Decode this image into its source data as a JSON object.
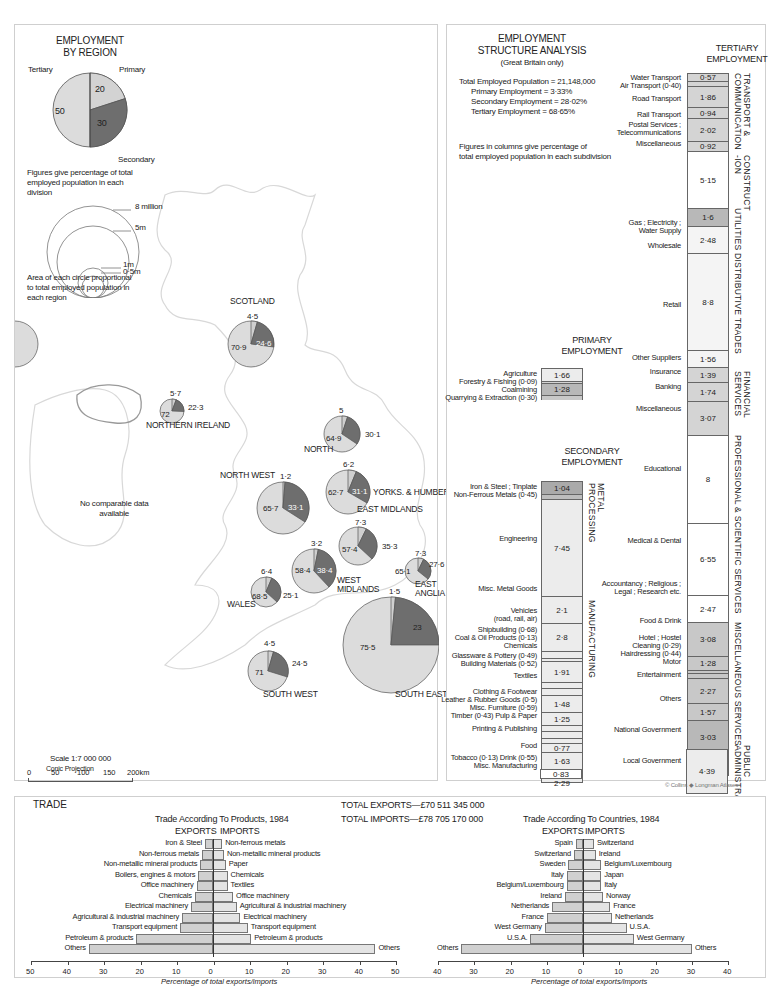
{
  "colors": {
    "primary": "#d9d9d9",
    "secondary": "#6e6e6e",
    "tertiary": "#dcdcdc",
    "border": "#666666",
    "map_line": "#d6d6d6",
    "shade_light": "#ececec",
    "shade_mid": "#d4d4d4",
    "shade_dark": "#b8b8b8"
  },
  "legend": {
    "title_line1": "EMPLOYMENT",
    "title_line2": "BY REGION",
    "labels": {
      "tertiary": "Tertiary",
      "primary": "Primary",
      "secondary": "Secondary"
    },
    "values": {
      "tertiary": "50",
      "primary": "20",
      "secondary": "30"
    },
    "note_line1": "Figures give percentage of total",
    "note_line2": "employed population in each",
    "note_line3": "division",
    "circles": [
      "8 million",
      "5m",
      "1m",
      "0·5m"
    ],
    "circle_note_line1": "Area of each circle proportional",
    "circle_note_line2": "to total employed population in",
    "circle_note_line3": "each region"
  },
  "map": {
    "no_data_line1": "No comparable data",
    "no_data_line2": "available",
    "scale_title": "Scale 1:7 000 000",
    "scale_ticks": [
      "0",
      "50",
      "100",
      "150",
      "200km"
    ],
    "projection": "Conic Projection",
    "copyright": "© Collins ◆ Longman Atlases"
  },
  "chart_data": [
    {
      "type": "pie",
      "title": "Employment by Region",
      "series_names": [
        "Primary",
        "Secondary",
        "Tertiary"
      ],
      "regions": [
        {
          "name": "SCOTLAND",
          "primary": 4.5,
          "secondary": 24.6,
          "tertiary": 70.9
        },
        {
          "name": "NORTHERN IRELAND",
          "primary": 5.7,
          "secondary": 22.3,
          "tertiary": 72
        },
        {
          "name": "NORTH",
          "primary": 5,
          "secondary": 30.1,
          "tertiary": 64.9
        },
        {
          "name": "YORKS. & HUMBERSIDE",
          "primary": 6.2,
          "secondary": 31.1,
          "tertiary": 62.7
        },
        {
          "name": "NORTH WEST",
          "primary": 1.2,
          "secondary": 33.1,
          "tertiary": 65.7
        },
        {
          "name": "EAST MIDLANDS",
          "primary": 7.3,
          "secondary": 35.3,
          "tertiary": 57.4
        },
        {
          "name": "WEST MIDLANDS",
          "primary": 3.2,
          "secondary": 38.4,
          "tertiary": 58.4
        },
        {
          "name": "EAST ANGLIA",
          "primary": 7.3,
          "secondary": 27.6,
          "tertiary": 65.1
        },
        {
          "name": "WALES",
          "primary": 6.4,
          "secondary": 25.1,
          "tertiary": 68.5
        },
        {
          "name": "SOUTH WEST",
          "primary": 4.5,
          "secondary": 24.5,
          "tertiary": 71
        },
        {
          "name": "SOUTH EAST",
          "primary": 1.5,
          "secondary": 23,
          "tertiary": 75.5
        }
      ]
    },
    {
      "type": "table",
      "title": "Employment Structure Analysis (Great Britain only)",
      "total_employed": 21148000,
      "primary_pct": 3.33,
      "secondary_pct": 28.02,
      "tertiary_pct": 68.65,
      "primary": [
        {
          "name": "Agriculture",
          "value": 1.66
        },
        {
          "name": "Forestry & Fishing",
          "value": 0.09
        },
        {
          "name": "Coalmining",
          "value": 1.28
        },
        {
          "name": "Quarrying & Extraction",
          "value": 0.3
        }
      ],
      "secondary": [
        {
          "name": "Iron & Steel ; Tinplate",
          "value": 1.04
        },
        {
          "name": "Non-Ferrous Metals",
          "value": 0.45
        },
        {
          "name": "Engineering",
          "value": 7.45
        },
        {
          "name": "Misc. Metal Goods",
          "value": 2.1
        },
        {
          "name": "Vehicles (road, rail, air)",
          "value": 2.8
        },
        {
          "name": "Shipbuilding",
          "value": 0.68
        },
        {
          "name": "Coal & Oil Products",
          "value": 0.13
        },
        {
          "name": "Chemicals",
          "value": 1.91
        },
        {
          "name": "Glassware & Pottery",
          "value": 0.49
        },
        {
          "name": "Building Materials",
          "value": 0.52
        },
        {
          "name": "Textiles",
          "value": 1.48
        },
        {
          "name": "Clothing & Footwear",
          "value": 1.25
        },
        {
          "name": "Leather & Rubber Goods",
          "value": 0.5
        },
        {
          "name": "Misc. Furniture",
          "value": 0.59
        },
        {
          "name": "Timber",
          "value": 0.43
        },
        {
          "name": "Pulp & Paper",
          "value": 0.77
        },
        {
          "name": "Printing & Publishing",
          "value": 1.63
        },
        {
          "name": "Food",
          "value": 2.29
        },
        {
          "name": "Drink",
          "value": 0.55
        },
        {
          "name": "Tobacco",
          "value": 0.13
        },
        {
          "name": "Misc. Manufacturing",
          "value": 0.83
        }
      ],
      "tertiary": [
        {
          "name": "Water Transport",
          "value": 0.57
        },
        {
          "name": "Air Transport",
          "value": 0.4
        },
        {
          "name": "Road Transport",
          "value": 1.86
        },
        {
          "name": "Rail Transport",
          "value": 0.94
        },
        {
          "name": "Postal Services ; Telecommunications",
          "value": 2.02
        },
        {
          "name": "Miscellaneous (Transport)",
          "value": 0.92
        },
        {
          "name": "Construction",
          "value": 5.15
        },
        {
          "name": "Gas ; Electricity ; Water Supply",
          "value": 1.6
        },
        {
          "name": "Wholesale",
          "value": 2.48
        },
        {
          "name": "Retail",
          "value": 8.8
        },
        {
          "name": "Other Suppliers",
          "value": 1.56
        },
        {
          "name": "Insurance",
          "value": 1.39
        },
        {
          "name": "Banking",
          "value": 1.74
        },
        {
          "name": "Miscellaneous (Financial)",
          "value": 3.07
        },
        {
          "name": "Educational",
          "value": 8.0
        },
        {
          "name": "Medical & Dental",
          "value": 6.55
        },
        {
          "name": "Accountancy ; Religious ; Legal ; Research etc.",
          "value": 2.47
        },
        {
          "name": "Food & Drink",
          "value": 3.08
        },
        {
          "name": "Hotel ; Hostel",
          "value": 1.28
        },
        {
          "name": "Cleaning",
          "value": 0.29
        },
        {
          "name": "Hairdressing",
          "value": 0.44
        },
        {
          "name": "Motor",
          "value": 2.27
        },
        {
          "name": "Entertainment",
          "value": 1.57
        },
        {
          "name": "Others",
          "value": 3.03
        },
        {
          "name": "National Government",
          "value": 2.78
        },
        {
          "name": "Local Government",
          "value": 4.39
        }
      ]
    },
    {
      "type": "bar",
      "title": "Trade According To Products, 1984",
      "xlabel": "Percentage of total exports/imports",
      "xlim": [
        -50,
        50
      ],
      "ticks": [
        "50",
        "40",
        "30",
        "20",
        "10",
        "0",
        "10",
        "20",
        "30",
        "40",
        "50"
      ],
      "exports": [
        {
          "name": "Iron & Steel",
          "value": 2.2
        },
        {
          "name": "Non-ferrous metals",
          "value": 3
        },
        {
          "name": "Non-metallic mineral products",
          "value": 3.5
        },
        {
          "name": "Boilers, engines & motors",
          "value": 4
        },
        {
          "name": "Office machinery",
          "value": 4.5
        },
        {
          "name": "Chemicals",
          "value": 5
        },
        {
          "name": "Electrical machinery",
          "value": 6
        },
        {
          "name": "Agricultural & industrial machinery",
          "value": 8.5
        },
        {
          "name": "Transport equipment",
          "value": 9
        },
        {
          "name": "Petroleum & products",
          "value": 21
        },
        {
          "name": "Others",
          "value": 34
        }
      ],
      "imports": [
        {
          "name": "Non-ferrous metals",
          "value": 2.5
        },
        {
          "name": "Non-metallic mineral products",
          "value": 3
        },
        {
          "name": "Paper",
          "value": 3.5
        },
        {
          "name": "Chemicals",
          "value": 4
        },
        {
          "name": "Textiles",
          "value": 4
        },
        {
          "name": "Office machinery",
          "value": 5.5
        },
        {
          "name": "Agricultural & industrial machinery",
          "value": 6.5
        },
        {
          "name": "Electrical machinery",
          "value": 7.5
        },
        {
          "name": "Transport equipment",
          "value": 9.5
        },
        {
          "name": "Petroleum & products",
          "value": 10.5
        },
        {
          "name": "Others",
          "value": 44.5
        }
      ]
    },
    {
      "type": "bar",
      "title": "Trade According To Countries, 1984",
      "xlabel": "Percentage of total exports/imports",
      "xlim": [
        -40,
        40
      ],
      "ticks": [
        "40",
        "30",
        "20",
        "10",
        "0",
        "10",
        "20",
        "30",
        "40"
      ],
      "exports": [
        {
          "name": "Spain",
          "value": 2
        },
        {
          "name": "Switzerland",
          "value": 2.5
        },
        {
          "name": "Sweden",
          "value": 4
        },
        {
          "name": "Italy",
          "value": 4.5
        },
        {
          "name": "Belgium/Luxembourg",
          "value": 4.5
        },
        {
          "name": "Ireland",
          "value": 5
        },
        {
          "name": "Netherlands",
          "value": 8.5
        },
        {
          "name": "France",
          "value": 10
        },
        {
          "name": "West Germany",
          "value": 10.5
        },
        {
          "name": "U.S.A.",
          "value": 14.5
        },
        {
          "name": "Others",
          "value": 33.5
        }
      ],
      "imports": [
        {
          "name": "Switzerland",
          "value": 3
        },
        {
          "name": "Ireland",
          "value": 3.5
        },
        {
          "name": "Belgium/Luxembourg",
          "value": 5
        },
        {
          "name": "Japan",
          "value": 5
        },
        {
          "name": "Italy",
          "value": 5
        },
        {
          "name": "Norway",
          "value": 5.5
        },
        {
          "name": "France",
          "value": 7.5
        },
        {
          "name": "Netherlands",
          "value": 8
        },
        {
          "name": "U.S.A.",
          "value": 12
        },
        {
          "name": "West Germany",
          "value": 14
        },
        {
          "name": "Others",
          "value": 30
        }
      ]
    }
  ],
  "structure": {
    "title_line1": "EMPLOYMENT",
    "title_line2": "STRUCTURE ANALYSIS",
    "subtitle": "(Great Britain only)",
    "total_line": "Total Employed Population = 21,148,000",
    "primary_line": "Primary Employment    = 3·33%",
    "secondary_line": "Secondary Employment = 28·02%",
    "tertiary_line": "Tertiary Employment    = 68·65%",
    "note_line1": "Figures in columns give percentage of",
    "note_line2": "total employed population in each subdivision",
    "primary_title1": "PRIMARY",
    "primary_title2": "EMPLOYMENT",
    "secondary_title1": "SECONDARY",
    "secondary_title2": "EMPLOYMENT",
    "tertiary_title1": "TERTIARY",
    "tertiary_title2": "EMPLOYMENT"
  },
  "trade": {
    "title": "TRADE",
    "total_exports": "TOTAL EXPORTS—£70 511 345 000",
    "total_imports": "TOTAL IMPORTS—£78 705 170 000",
    "exports_label": "EXPORTS",
    "imports_label": "IMPORTS"
  }
}
